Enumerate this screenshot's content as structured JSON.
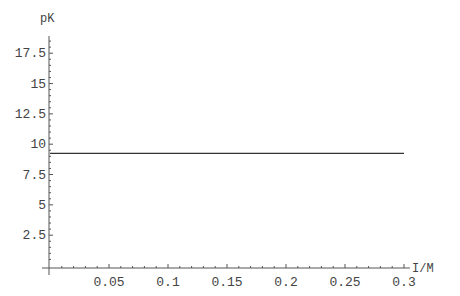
{
  "chart_data": {
    "type": "line",
    "title": "",
    "xlabel": "I/M",
    "ylabel": "pK",
    "xlim": [
      0,
      0.3
    ],
    "ylim": [
      0,
      19
    ],
    "x_ticks": [
      0.05,
      0.1,
      0.15,
      0.2,
      0.25,
      0.3
    ],
    "x_tick_labels": [
      "0.05",
      "0.1",
      "0.15",
      "0.2",
      "0.25",
      "0.3"
    ],
    "y_ticks": [
      2.5,
      5,
      7.5,
      10,
      12.5,
      15,
      17.5
    ],
    "y_tick_labels": [
      "2.5",
      "5",
      "7.5",
      "10",
      "12.5",
      "15",
      "17.5"
    ],
    "grid": false,
    "legend": null,
    "series": [
      {
        "name": "pK",
        "x": [
          0,
          0.05,
          0.1,
          0.15,
          0.2,
          0.25,
          0.3
        ],
        "y": [
          9.25,
          9.25,
          9.25,
          9.25,
          9.25,
          9.25,
          9.25
        ],
        "color": "#333333"
      }
    ]
  },
  "axes": {
    "x_label": "I/M",
    "y_label": "pK"
  },
  "colors": {
    "axis": "#555555",
    "line": "#333333",
    "text": "#444444"
  }
}
